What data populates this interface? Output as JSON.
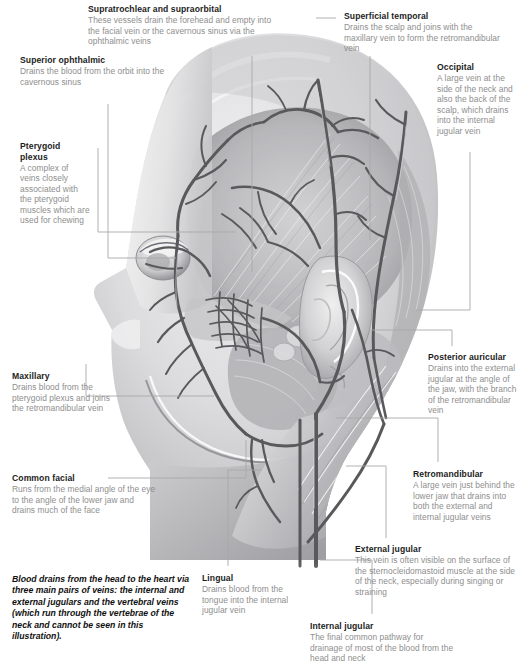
{
  "figure": {
    "style": "grayscale medical illustration",
    "caption": "Blood drains from the head to the heart via three main pairs of veins: the internal and external jugulars and the vertebral veins (which run through the vertebrae of the neck and cannot be seen in this illustration)."
  },
  "colors": {
    "background": "#ffffff",
    "title_text": "#1d1d1d",
    "body_text": "#8e8e8e",
    "leader_line": "#a8a8a8",
    "vein_dark": "#59595c",
    "tissue_mid": "#b9b9bb",
    "tissue_light": "#e2e2e3",
    "tissue_dark": "#8a8a8d"
  },
  "callouts": [
    {
      "id": "supratrochlear-supraorbital",
      "title": "Supratrochlear and supraorbital",
      "body": "These vessels drain the forehead and empty into the facial vein or the cavernous sinus via the ophthalmic veins"
    },
    {
      "id": "superior-ophthalmic",
      "title": "Superior ophthalmic",
      "body": "Drains the blood from the orbit into the cavernous sinus"
    },
    {
      "id": "pterygoid-plexus",
      "title": "Pterygoid plexus",
      "body": "A complex of veins closely associated with the pterygoid muscles which are used for chewing"
    },
    {
      "id": "maxillary",
      "title": "Maxillary",
      "body": "Drains blood from the pterygoid plexus and joins the retromandibular vein"
    },
    {
      "id": "common-facial",
      "title": "Common facial",
      "body": "Runs from the medial angle of the eye to the angle of the lower jaw and drains much of the face"
    },
    {
      "id": "superficial-temporal",
      "title": "Superficial temporal",
      "body": "Drains the scalp and joins with the maxillary vein to form the retromandibular vein"
    },
    {
      "id": "occipital",
      "title": "Occipital",
      "body": "A large vein at the side of the neck and also the back of the scalp, which drains into the internal jugular vein"
    },
    {
      "id": "posterior-auricular",
      "title": "Posterior auricular",
      "body": "Drains into the external jugular at the angle of the jaw, with the branch of the retromandibular vein"
    },
    {
      "id": "retromandibular",
      "title": "Retromandibular",
      "body": "A large vein just behind the lower jaw that drains into both the external and internal jugular veins"
    },
    {
      "id": "external-jugular",
      "title": "External jugular",
      "body": "This vein is often visible on the surface of the sternocleidomastoid muscle at the side of the neck, especially during singing or straining"
    },
    {
      "id": "internal-jugular",
      "title": "Internal jugular",
      "body": "The final common pathway for drainage of most of the blood from the head and neck"
    },
    {
      "id": "lingual",
      "title": "Lingual",
      "body": "Drains blood from the tongue into the internal jugular vein"
    }
  ]
}
